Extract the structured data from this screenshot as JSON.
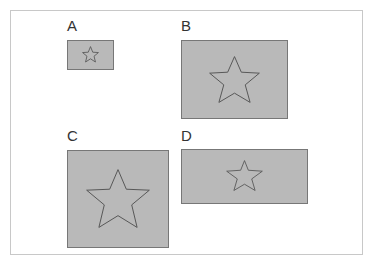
{
  "diagram": {
    "title": "",
    "panels": [
      {
        "id": "A",
        "label": "A",
        "shape": "star-icon",
        "aspect": "wide",
        "size": "small"
      },
      {
        "id": "B",
        "label": "B",
        "shape": "star-icon",
        "aspect": "wide",
        "size": "large"
      },
      {
        "id": "C",
        "label": "C",
        "shape": "star-icon",
        "aspect": "square",
        "size": "large"
      },
      {
        "id": "D",
        "label": "D",
        "shape": "star-icon",
        "aspect": "very-wide",
        "size": "medium"
      }
    ],
    "colors": {
      "box_fill": "#b9b9b9",
      "box_border": "#777777",
      "star_stroke": "#555555",
      "frame_border": "#c8c8c8"
    }
  }
}
